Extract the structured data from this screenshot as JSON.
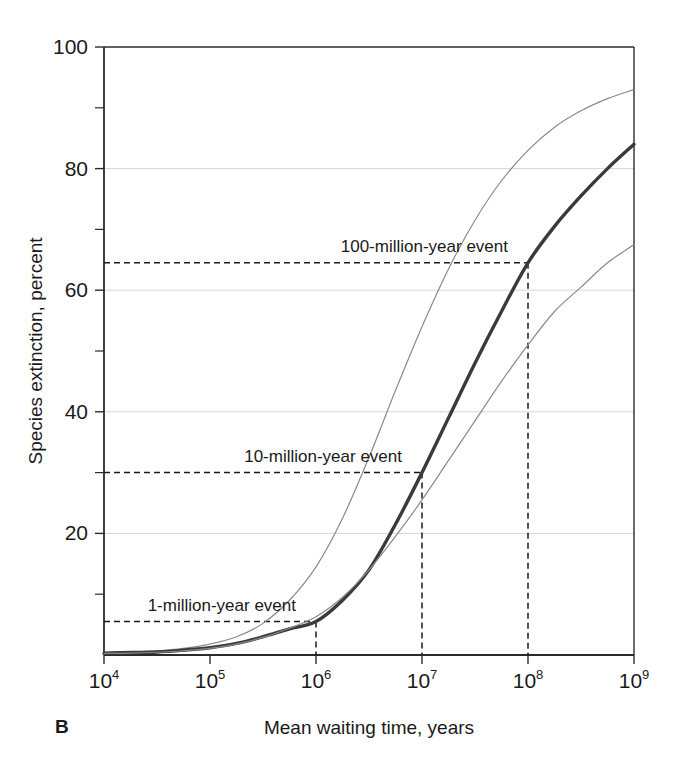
{
  "figure": {
    "panel_label": "B",
    "background_color": "#ffffff",
    "axis_color": "#2b2b2b",
    "grid_color": "#d5d5d5",
    "main_curve_color": "#3a3a3a",
    "bound_curve_color": "#8a8a8a",
    "annotation_color": "#1a1a1a"
  },
  "chart_data": {
    "type": "line",
    "title": "",
    "subtitle": "",
    "xlabel": "Mean waiting time, years",
    "ylabel": "Species extinction, percent",
    "xscale": "log",
    "xlim": [
      10000,
      1000000000
    ],
    "ylim": [
      0,
      100
    ],
    "grid": "horizontal-major",
    "legend": "none",
    "x_tick_labels": [
      "10⁴",
      "10⁵",
      "10⁶",
      "10⁷",
      "10⁸",
      "10⁹"
    ],
    "x_tick_bases": [
      "10",
      "10",
      "10",
      "10",
      "10",
      "10"
    ],
    "x_tick_exponents": [
      "4",
      "5",
      "6",
      "7",
      "8",
      "9"
    ],
    "x_tick_values": [
      10000,
      100000,
      1000000,
      10000000,
      100000000,
      1000000000
    ],
    "y_tick_labels": [
      "20",
      "40",
      "60",
      "80",
      "100"
    ],
    "y_tick_values": [
      20,
      40,
      60,
      80,
      100
    ],
    "y_minor_tick_values": [
      10,
      30,
      50,
      70,
      90
    ],
    "x": [
      10000,
      17800,
      31600,
      56200,
      100000,
      178000,
      316000,
      562000,
      1000000,
      1780000,
      3160000,
      5620000,
      10000000,
      17800000,
      31600000,
      56200000,
      100000000,
      178000000,
      316000000,
      562000000,
      1000000000
    ],
    "series": [
      {
        "name": "upper-bound",
        "style": "thin",
        "values": [
          0.4,
          0.5,
          0.7,
          1.1,
          1.8,
          3.0,
          5.2,
          9.0,
          14.5,
          22.5,
          32.5,
          43.5,
          54.0,
          63.5,
          71.5,
          78.0,
          83.0,
          86.8,
          89.5,
          91.5,
          93.0
        ]
      },
      {
        "name": "best-estimate",
        "style": "thick",
        "values": [
          0.3,
          0.4,
          0.5,
          0.8,
          1.2,
          1.9,
          3.0,
          4.3,
          5.5,
          9.0,
          14.0,
          21.5,
          30.0,
          39.0,
          48.0,
          56.5,
          64.5,
          70.5,
          75.5,
          80.0,
          84.0
        ]
      },
      {
        "name": "lower-bound",
        "style": "thin",
        "values": [
          0.25,
          0.3,
          0.45,
          0.7,
          1.1,
          1.8,
          2.9,
          4.4,
          6.3,
          9.5,
          14.0,
          19.5,
          25.5,
          32.0,
          38.5,
          45.0,
          51.0,
          56.5,
          60.5,
          64.5,
          67.5
        ]
      }
    ],
    "annotations": [
      {
        "label": "100-million-year event",
        "x_value": 100000000,
        "y_value": 64.5,
        "guide": "dashed-corner"
      },
      {
        "label": "10-million-year event",
        "x_value": 10000000,
        "y_value": 30.0,
        "guide": "dashed-corner"
      },
      {
        "label": "1-million-year event",
        "x_value": 1000000,
        "y_value": 5.5,
        "guide": "dashed-corner"
      }
    ]
  }
}
